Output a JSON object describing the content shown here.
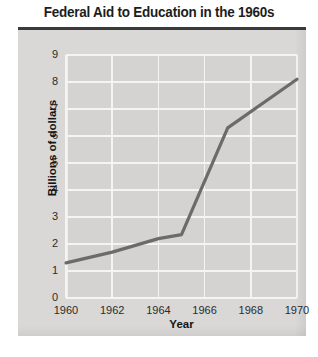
{
  "chart_data": {
    "type": "line",
    "title": "Federal Aid to Education in the 1960s",
    "xlabel": "Year",
    "ylabel": "Billions of dollars",
    "xlim": [
      1960,
      1970
    ],
    "ylim": [
      0,
      9
    ],
    "grid": true,
    "legend": "none",
    "xticks": [
      "1960",
      "1962",
      "1964",
      "1966",
      "1968",
      "1970"
    ],
    "xtick_values": [
      1960,
      1962,
      1964,
      1966,
      1968,
      1970
    ],
    "yticks": [
      "0",
      "1",
      "2",
      "3",
      "4",
      "5",
      "6",
      "7",
      "8",
      "9"
    ],
    "ytick_values": [
      0,
      1,
      2,
      3,
      4,
      5,
      6,
      7,
      8,
      9
    ],
    "series": [
      {
        "name": "Federal aid to education",
        "color": "#6b6b6b",
        "x": [
          1960,
          1962,
          1964,
          1965,
          1967,
          1970
        ],
        "values": [
          1.3,
          1.7,
          2.2,
          2.35,
          6.3,
          8.1
        ]
      }
    ]
  },
  "style": {
    "line_color": "#6b6b6b",
    "plot_background": "#d4d3d1",
    "panel_background": "#d9d8d6",
    "gridline_color": "#f4f4f3",
    "title_rule_color": "#3a3a3a",
    "text_color": "#2b2b2b"
  }
}
